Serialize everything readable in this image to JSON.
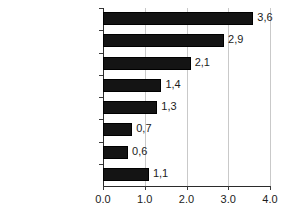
{
  "chart_data": {
    "type": "bar",
    "orientation": "horizontal",
    "title": "",
    "subtitle": "",
    "xlabel": "",
    "ylabel": "",
    "xlim": [
      0.0,
      4.0
    ],
    "grid": true,
    "legend": null,
    "legend_position": "none",
    "bar_color": "#141414",
    "decimal_separator_data_labels": ",",
    "decimal_separator_axis_labels": ".",
    "categories": [
      "Mexico/Chile",
      "Australia/New Zealand",
      "South Korea",
      "Canada",
      "OECD Europe",
      "United States",
      "Japan",
      "Total OECD"
    ],
    "values": [
      3.6,
      2.9,
      2.1,
      1.4,
      1.3,
      0.7,
      0.6,
      1.1
    ],
    "data_labels": [
      "3,6",
      "2,9",
      "2,1",
      "1,4",
      "1,3",
      "0,7",
      "0,6",
      "1,1"
    ],
    "emphasis": [
      false,
      false,
      false,
      false,
      false,
      false,
      false,
      true
    ],
    "xticks": [
      0.0,
      1.0,
      2.0,
      3.0,
      4.0
    ],
    "xtick_labels": [
      "0.0",
      "1.0",
      "2.0",
      "3.0",
      "4.0"
    ]
  }
}
